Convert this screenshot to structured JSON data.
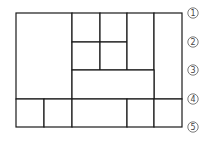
{
  "diagram": {
    "row_markers": [
      "1",
      "2",
      "3",
      "4",
      "5"
    ],
    "line_color": "#1a1a1a",
    "marker_color": "#444444",
    "cells": [
      {
        "id": "left-large",
        "rows": "1-4",
        "cols": "1-2"
      },
      {
        "id": "top-mid-a",
        "rows": "1-2",
        "cols": "3"
      },
      {
        "id": "top-mid-b",
        "rows": "1-2",
        "cols": "4"
      },
      {
        "id": "mid-a",
        "rows": "2-3",
        "cols": "3"
      },
      {
        "id": "mid-b",
        "rows": "2-3",
        "cols": "4"
      },
      {
        "id": "tall-col-5",
        "rows": "1-3",
        "cols": "5"
      },
      {
        "id": "right-tall",
        "rows": "1-4",
        "cols": "6"
      },
      {
        "id": "wide-row-3",
        "rows": "3-4",
        "cols": "3-5"
      },
      {
        "id": "bottom-1",
        "rows": "4-5",
        "cols": "1"
      },
      {
        "id": "bottom-2",
        "rows": "4-5",
        "cols": "2"
      },
      {
        "id": "bottom-3",
        "rows": "4-5",
        "cols": "3-4"
      },
      {
        "id": "bottom-4",
        "rows": "4-5",
        "cols": "5"
      },
      {
        "id": "bottom-5",
        "rows": "4-5",
        "cols": "6"
      }
    ]
  }
}
